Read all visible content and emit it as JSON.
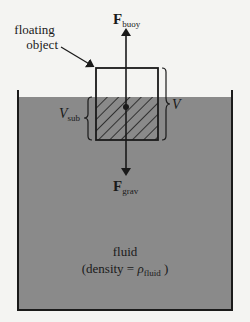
{
  "diagram": {
    "labels": {
      "object_line1": "floating",
      "object_line2": "object",
      "force_buoy_main": "F",
      "force_buoy_sub": "buoy",
      "force_grav_main": "F",
      "force_grav_sub": "grav",
      "volume_total": "V",
      "volume_sub_main": "V",
      "volume_sub_sub": "sub",
      "fluid_name": "fluid",
      "fluid_density_prefix": "(density = ",
      "fluid_density_symbol": "ρ",
      "fluid_density_sub": "fluid",
      "fluid_density_suffix": " )"
    },
    "colors": {
      "background": "#f4f4f2",
      "fluid": "#8a8a8a",
      "lines": "#1a1a1a",
      "object_fill": "#f4f4f2"
    }
  }
}
